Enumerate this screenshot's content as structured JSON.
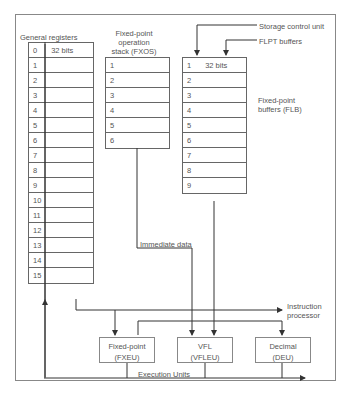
{
  "diagram": {
    "general_registers": {
      "title": "General registers",
      "rows": [
        "0",
        "1",
        "2",
        "3",
        "4",
        "5",
        "6",
        "7",
        "8",
        "9",
        "10",
        "11",
        "12",
        "13",
        "14",
        "15"
      ],
      "first_row_note": "32 bits"
    },
    "fxos": {
      "title_line1": "Fixed-point",
      "title_line2": "operation",
      "title_line3": "stack (FXOS)",
      "rows": [
        "1",
        "2",
        "3",
        "4",
        "5",
        "6"
      ]
    },
    "flb": {
      "title_line1": "Fixed-point",
      "title_line2": "buffers (FLB)",
      "rows": [
        "1",
        "2",
        "3",
        "4",
        "5",
        "6",
        "7",
        "8",
        "9"
      ],
      "first_row_note": "32 bits"
    },
    "inputs": {
      "storage_control_unit": "Storage control unit",
      "flpt_buffers": "FLPT buffers"
    },
    "immediate_data": "Immediate data",
    "instruction_processor_line1": "Instruction",
    "instruction_processor_line2": "processor",
    "execution_units_label": "Execution Units",
    "units": [
      {
        "line1": "Fixed-point",
        "line2": "(FXEU)"
      },
      {
        "line1": "VFL",
        "line2": "(VFLEU)"
      },
      {
        "line1": "Decimal",
        "line2": "(DEU)"
      }
    ]
  }
}
